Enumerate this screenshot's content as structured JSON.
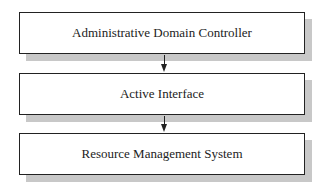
{
  "diagram": {
    "boxes": [
      {
        "label": "Administrative Domain Controller"
      },
      {
        "label": "Active Interface"
      },
      {
        "label": "Resource Management System"
      }
    ],
    "arrows": [
      {
        "from": "Administrative Domain Controller",
        "to": "Active Interface"
      },
      {
        "from": "Active Interface",
        "to": "Resource Management System"
      }
    ]
  }
}
